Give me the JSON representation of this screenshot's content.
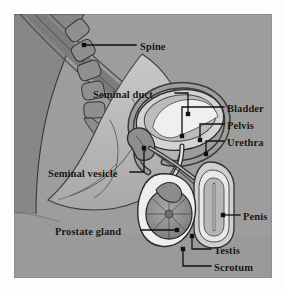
{
  "figure": {
    "panel": {
      "background_color": "#9d9d9d",
      "border_color": "#b9b9b9",
      "page_background": "#fdfdfd"
    },
    "style": {
      "label_color": "#131313",
      "leader_line_color": "#101010",
      "outline_color": "#2a2a2a",
      "tissue_light": "#d8d8d8",
      "tissue_mid": "#b0b0b0",
      "tissue_dark": "#8a8a8a",
      "organ_fill": "#9a9a9a",
      "highlight_fill": "#f2f2f2"
    }
  },
  "labels": [
    {
      "id": "spine",
      "text": "Spine",
      "x": 126,
      "y": 27,
      "align": "left"
    },
    {
      "id": "seminal-duct",
      "text": "Seminal duct",
      "x": 79,
      "y": 75,
      "align": "left"
    },
    {
      "id": "bladder",
      "text": "Bladder",
      "x": 213,
      "y": 89,
      "align": "left"
    },
    {
      "id": "pelvis",
      "text": "Pelvis",
      "x": 213,
      "y": 106,
      "align": "left"
    },
    {
      "id": "urethra",
      "text": "Urethra",
      "x": 213,
      "y": 123,
      "align": "left"
    },
    {
      "id": "seminal-vesicle",
      "text": "Seminal vesicle",
      "x": 34,
      "y": 154,
      "align": "left"
    },
    {
      "id": "penis",
      "text": "Penis",
      "x": 229,
      "y": 197,
      "align": "left"
    },
    {
      "id": "prostate-gland",
      "text": "Prostate gland",
      "x": 41,
      "y": 212,
      "align": "left"
    },
    {
      "id": "testis",
      "text": "Testis",
      "x": 200,
      "y": 231,
      "align": "left"
    },
    {
      "id": "scrotum",
      "text": "Scrotum",
      "x": 200,
      "y": 248,
      "align": "left"
    }
  ],
  "leaders": [
    {
      "id": "spine",
      "path": "M 122 31 L 70 31",
      "dot": [
        70,
        31
      ]
    },
    {
      "id": "seminal-duct",
      "path": "M 161 79 L 174 79 L 174 100",
      "dot": [
        174,
        100
      ]
    },
    {
      "id": "bladder",
      "path": "M 210 93 L 168 93 L 168 122",
      "dot": [
        168,
        122
      ]
    },
    {
      "id": "pelvis",
      "path": "M 210 110 L 186 110 L 186 126",
      "dot": [
        186,
        126
      ]
    },
    {
      "id": "urethra",
      "path": "M 210 127 L 192 127 L 192 140",
      "dot": [
        192,
        140
      ]
    },
    {
      "id": "seminal-vesicle",
      "path": "M 116 158 L 130 158 L 130 134",
      "dot": [
        130,
        134
      ]
    },
    {
      "id": "penis",
      "path": "M 226 201 L 209 201",
      "dot": [
        209,
        201
      ]
    },
    {
      "id": "prostate-gland",
      "path": "M 127 216 L 163 216",
      "dot": [
        163,
        216
      ]
    },
    {
      "id": "testis",
      "path": "M 197 235 L 178 235 L 178 222",
      "dot": [
        178,
        222
      ]
    },
    {
      "id": "scrotum",
      "path": "M 197 252 L 169 252 L 169 235",
      "dot": [
        169,
        235
      ]
    }
  ]
}
